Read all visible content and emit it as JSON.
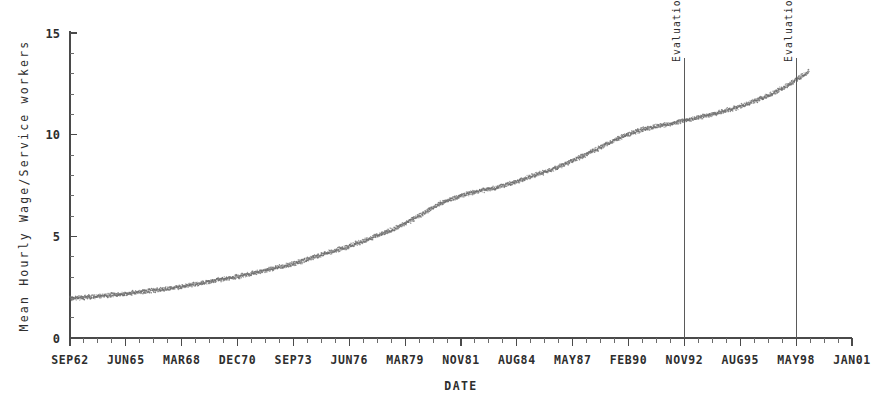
{
  "chart_data": {
    "type": "scatter",
    "title": "",
    "xlabel": "DATE",
    "ylabel": "Mean Hourly Wage/Service workers",
    "ylim": [
      0,
      15
    ],
    "yticks": [
      0,
      5,
      10,
      15
    ],
    "ytick_labels": [
      "0",
      "5",
      "10",
      "15"
    ],
    "grid": false,
    "legend": "none",
    "xtick_labels": [
      "SEP62",
      "JUN65",
      "MAR68",
      "DEC70",
      "SEP73",
      "JUN76",
      "MAR79",
      "NOV81",
      "AUG84",
      "MAY87",
      "FEB90",
      "NOV92",
      "AUG95",
      "MAY98",
      "JAN01"
    ],
    "x_minor_ticks_per_major": 4,
    "series": [
      {
        "name": "Mean Hourly Wage, Service workers",
        "x": [
          "SEP62",
          "SEP63",
          "SEP64",
          "JUN65",
          "JUN66",
          "JUN67",
          "MAR68",
          "MAR69",
          "MAR70",
          "DEC70",
          "DEC71",
          "DEC72",
          "SEP73",
          "SEP74",
          "SEP75",
          "JUN76",
          "JUN77",
          "JUN78",
          "MAR79",
          "MAR80",
          "MAR81",
          "NOV81",
          "NOV82",
          "NOV83",
          "AUG84",
          "AUG85",
          "AUG86",
          "MAY87",
          "MAY88",
          "MAY89",
          "FEB90",
          "FEB91",
          "FEB92",
          "NOV92",
          "NOV93",
          "NOV94",
          "AUG95",
          "AUG96",
          "AUG97",
          "MAY98",
          "MAY99"
        ],
        "values": [
          1.95,
          2.02,
          2.1,
          2.18,
          2.28,
          2.4,
          2.52,
          2.68,
          2.85,
          3.0,
          3.2,
          3.42,
          3.62,
          3.9,
          4.2,
          4.48,
          4.8,
          5.15,
          5.55,
          6.05,
          6.6,
          6.95,
          7.2,
          7.38,
          7.62,
          7.95,
          8.25,
          8.62,
          9.05,
          9.5,
          9.95,
          10.25,
          10.45,
          10.62,
          10.85,
          11.05,
          11.3,
          11.62,
          12.0,
          12.5,
          13.1
        ]
      }
    ],
    "annotations": [
      {
        "id": "eval-begin",
        "label": "Evaluation Period Begins",
        "x_label": "NOV92",
        "orientation": "vertical-rotated"
      },
      {
        "id": "eval-end",
        "label": "Evaluation Period Ends",
        "x_label": "MAY98",
        "orientation": "vertical-rotated"
      }
    ],
    "colors": {
      "data": "#6e6e6e",
      "axis": "#4a4a4a",
      "text": "#2e2e2e",
      "reference_line": "#5a5a5a",
      "background": "#ffffff"
    }
  }
}
